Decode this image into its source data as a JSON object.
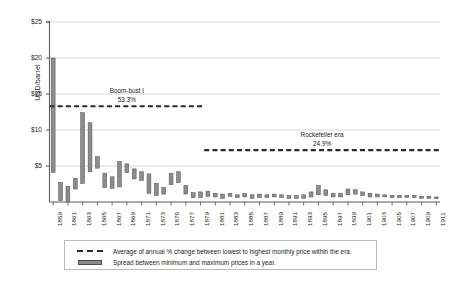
{
  "chart_data": {
    "type": "bar",
    "title": "",
    "subtitle": "",
    "xlabel": "",
    "ylabel": "USD/barrel",
    "ylim": [
      0,
      25
    ],
    "xlim": [
      1859,
      1911
    ],
    "grid": true,
    "legend_position": "bottom",
    "y_ticks": [
      "$25",
      "$20",
      "$15",
      "$10",
      "$5"
    ],
    "y_tick_values": [
      25,
      20,
      15,
      10,
      5
    ],
    "x_ticks": [
      "1859",
      "1861",
      "1863",
      "1865",
      "1867",
      "1869",
      "1871",
      "1873",
      "1875",
      "1877",
      "1879",
      "1881",
      "1883",
      "1885",
      "1887",
      "1889",
      "1891",
      "1893",
      "1895",
      "1897",
      "1899",
      "1901",
      "1903",
      "1905",
      "1907",
      "1909",
      "1911"
    ],
    "series": [
      {
        "name": "Spread between minimum and maximum prices in a year.",
        "type": "range-bar",
        "color": "#8d8d8d",
        "edge_color": "#4d4d4d",
        "years": [
          1859,
          1860,
          1861,
          1862,
          1863,
          1864,
          1865,
          1866,
          1867,
          1868,
          1869,
          1870,
          1871,
          1872,
          1873,
          1874,
          1875,
          1876,
          1877,
          1878,
          1879,
          1880,
          1881,
          1882,
          1883,
          1884,
          1885,
          1886,
          1887,
          1888,
          1889,
          1890,
          1891,
          1892,
          1893,
          1894,
          1895,
          1896,
          1897,
          1898,
          1899,
          1900,
          1901,
          1902,
          1903,
          1904,
          1905,
          1906,
          1907,
          1908,
          1909,
          1910,
          1911
        ],
        "min": [
          4.1,
          0.2,
          0.1,
          1.8,
          2.6,
          4.2,
          4.7,
          2.0,
          1.9,
          2.1,
          4.1,
          3.2,
          3.0,
          1.2,
          0.9,
          1.1,
          2.4,
          2.7,
          1.1,
          0.6,
          0.6,
          0.8,
          0.7,
          0.5,
          0.8,
          0.6,
          0.7,
          0.5,
          0.6,
          0.6,
          0.7,
          0.6,
          0.5,
          0.5,
          0.5,
          0.7,
          1.0,
          0.9,
          0.7,
          0.7,
          1.0,
          1.1,
          0.9,
          0.7,
          0.7,
          0.7,
          0.6,
          0.6,
          0.6,
          0.6,
          0.5,
          0.5,
          0.5
        ],
        "max": [
          20.0,
          2.7,
          2.2,
          3.3,
          12.4,
          11.0,
          6.3,
          4.0,
          3.5,
          5.6,
          5.3,
          4.6,
          4.2,
          3.9,
          2.6,
          2.0,
          4.0,
          4.2,
          2.3,
          1.3,
          1.4,
          1.5,
          1.2,
          1.1,
          1.2,
          1.0,
          1.2,
          1.0,
          1.1,
          1.0,
          1.1,
          1.0,
          0.9,
          0.9,
          1.0,
          1.4,
          2.3,
          1.7,
          1.2,
          1.2,
          1.8,
          1.7,
          1.4,
          1.2,
          1.1,
          1.0,
          0.9,
          0.9,
          0.9,
          0.9,
          0.8,
          0.8,
          0.7
        ]
      }
    ],
    "annotations": [
      {
        "label": "Boom-bust I",
        "value": "53.3%",
        "level": 13.3,
        "start_year": 1859,
        "end_year": 1879,
        "style": "dashed"
      },
      {
        "label": "Rockefeller era",
        "value": "24.9%",
        "level": 7.2,
        "start_year": 1880,
        "end_year": 1911,
        "style": "dashed"
      }
    ]
  },
  "legend": {
    "items": [
      {
        "key": "dashed-line-key",
        "label": "Average of annual % change between lowest to highest monthly price within the era."
      },
      {
        "key": "bar-key",
        "label": "Spread between minimum and maximum prices in a year."
      }
    ]
  },
  "colors": {
    "bar_fill": "#8d8d8d",
    "bar_edge": "#4d4d4d",
    "dash": "#2b2b2b",
    "grid": "#c8c8c8",
    "axis": "#5a5a5a",
    "text": "#231f20"
  }
}
